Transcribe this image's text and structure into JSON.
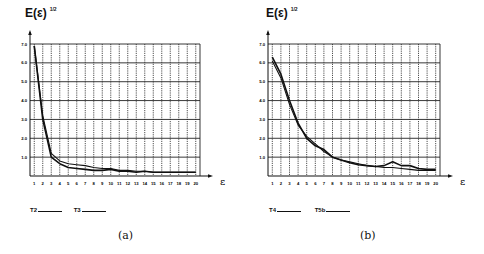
{
  "figure": {
    "panels": [
      {
        "id": "a",
        "caption": "(a)",
        "ylabel": "E(ε)",
        "ylabel_sup": "1/2",
        "xlabel": "ε",
        "legend": [
          {
            "label": "T2",
            "style": "solid"
          },
          {
            "label": "T3",
            "style": "solid"
          }
        ]
      },
      {
        "id": "b",
        "caption": "(b)",
        "ylabel": "E(ε)",
        "ylabel_sup": "1/2",
        "xlabel": "ε",
        "legend": [
          {
            "label": "T4",
            "style": "solid"
          },
          {
            "label": "T5b",
            "style": "solid"
          }
        ]
      }
    ]
  },
  "chart_data": [
    {
      "type": "line",
      "title": "(a)",
      "xlabel": "ε",
      "ylabel": "E(ε)^1/2",
      "x": [
        1,
        2,
        3,
        4,
        5,
        6,
        7,
        8,
        9,
        10,
        11,
        12,
        13,
        14,
        15,
        16,
        17,
        18,
        19,
        20
      ],
      "x_ticks": [
        "1",
        "2",
        "3",
        "4",
        "5",
        "6",
        "7",
        "8",
        "9",
        "10",
        "11",
        "12",
        "13",
        "14",
        "15",
        "16",
        "17",
        "18",
        "19",
        "20"
      ],
      "y_ticks": [
        "1.0",
        "2.0",
        "3.0",
        "4.0",
        "5.0",
        "6.0",
        "7.0"
      ],
      "ylim": [
        0,
        7
      ],
      "grid": true,
      "legend_position": "bottom-left",
      "series": [
        {
          "name": "T2",
          "values": [
            6.9,
            3.0,
            1.0,
            0.65,
            0.45,
            0.4,
            0.35,
            0.3,
            0.3,
            0.35,
            0.25,
            0.25,
            0.2,
            0.25,
            0.2,
            0.2,
            0.2,
            0.2,
            0.2,
            0.2
          ]
        },
        {
          "name": "T3",
          "values": [
            6.9,
            3.2,
            1.2,
            0.8,
            0.65,
            0.6,
            0.55,
            0.45,
            0.4,
            0.4,
            0.3,
            0.3,
            0.25,
            0.25,
            0.2,
            0.2,
            0.2,
            0.2,
            0.2,
            0.2
          ]
        }
      ]
    },
    {
      "type": "line",
      "title": "(b)",
      "xlabel": "ε",
      "ylabel": "E(ε)^1/2",
      "x": [
        1,
        2,
        3,
        4,
        5,
        6,
        7,
        8,
        9,
        10,
        11,
        12,
        13,
        14,
        15,
        16,
        17,
        18,
        19,
        20
      ],
      "x_ticks": [
        "1",
        "2",
        "3",
        "4",
        "5",
        "6",
        "7",
        "8",
        "9",
        "10",
        "11",
        "12",
        "13",
        "14",
        "15",
        "16",
        "17",
        "18",
        "19",
        "20"
      ],
      "y_ticks": [
        "1.0",
        "2.0",
        "3.0",
        "4.0",
        "5.0",
        "6.0",
        "7.0"
      ],
      "ylim": [
        0,
        7
      ],
      "grid": true,
      "legend_position": "bottom-left",
      "series": [
        {
          "name": "T4",
          "values": [
            6.3,
            5.4,
            4.0,
            2.8,
            2.0,
            1.6,
            1.4,
            1.0,
            0.85,
            0.7,
            0.6,
            0.55,
            0.5,
            0.55,
            0.75,
            0.55,
            0.55,
            0.4,
            0.35,
            0.35
          ]
        },
        {
          "name": "T5b",
          "values": [
            6.1,
            5.2,
            3.8,
            2.7,
            2.1,
            1.7,
            1.3,
            1.0,
            0.85,
            0.75,
            0.65,
            0.55,
            0.5,
            0.45,
            0.45,
            0.4,
            0.35,
            0.3,
            0.3,
            0.3
          ]
        }
      ]
    }
  ]
}
